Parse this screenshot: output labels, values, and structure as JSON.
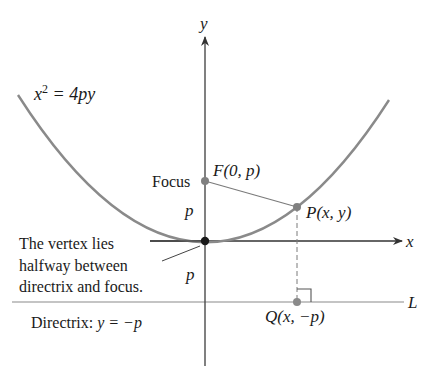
{
  "figure": {
    "equation": {
      "base": "x",
      "exp": "2",
      "rest": " = 4py"
    },
    "axes": {
      "x_label": "x",
      "y_label": "y"
    },
    "focus": {
      "word": "Focus",
      "label": "F(0, p)"
    },
    "point_p": {
      "label": "P(x, y)"
    },
    "point_q": {
      "label": "Q(x, −p)"
    },
    "directrix": {
      "line_label": "L",
      "caption_prefix": "Directrix: ",
      "caption_eq": "y = −p"
    },
    "distance_labels": {
      "upper": "p",
      "lower": "p"
    },
    "vertex_note": {
      "lines": [
        "The vertex lies",
        "halfway between",
        "directrix and focus."
      ]
    },
    "colors": {
      "curve": "#8a8a8a",
      "axis": "#4a4a4a",
      "text": "#1a1a1a",
      "point": "#808080",
      "vertex": "#1a1a1a"
    }
  }
}
